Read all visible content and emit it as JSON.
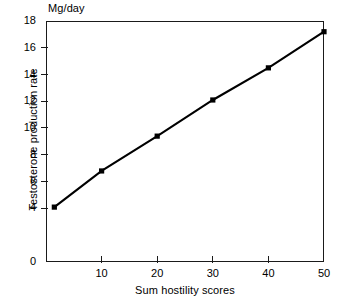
{
  "chart_data": {
    "type": "line",
    "title": "",
    "subtitle": "",
    "xlabel": "Sum hostility scores",
    "ylabel": "Testosterone production rate",
    "y_unit_label": "Mg/day",
    "xlim": [
      0,
      50
    ],
    "ylim": [
      0,
      18
    ],
    "grid": false,
    "legend": null,
    "frame": "box",
    "marker": "filled-square",
    "line_color": "#000000",
    "x_ticks": [
      10,
      20,
      30,
      40,
      50
    ],
    "x_tick_labels": [
      "10",
      "20",
      "30",
      "40",
      "50"
    ],
    "y_ticks": [
      0,
      4,
      6,
      8,
      10,
      12,
      14,
      16,
      18
    ],
    "y_tick_labels": [
      "0",
      "4",
      "6",
      "8",
      "10",
      "12",
      "14",
      "16",
      "18"
    ],
    "x": [
      1.5,
      10,
      20,
      30,
      40,
      50
    ],
    "values": [
      4.1,
      6.8,
      9.4,
      12.1,
      14.5,
      17.2
    ],
    "series": [
      {
        "name": "Testosterone production rate",
        "x": [
          1.5,
          10,
          20,
          30,
          40,
          50
        ],
        "values": [
          4.1,
          6.8,
          9.4,
          12.1,
          14.5,
          17.2
        ]
      }
    ],
    "annotations": []
  }
}
